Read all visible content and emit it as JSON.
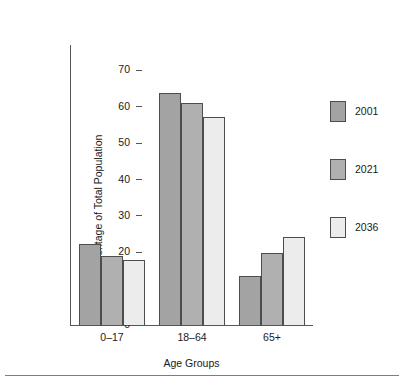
{
  "chart_data": {
    "type": "bar",
    "title": "",
    "subtitle": "",
    "xlabel": "Age Groups",
    "ylabel": "Percentage of Total Population",
    "categories": [
      "0–17",
      "18–64",
      "65+"
    ],
    "series": [
      {
        "name": "2001",
        "color": "#a3a3a3",
        "values": [
          22.4,
          63.7,
          13.5
        ]
      },
      {
        "name": "2021",
        "color": "#b0b0b0",
        "values": [
          19.0,
          61.0,
          19.8
        ]
      },
      {
        "name": "2036",
        "color": "#ececec",
        "values": [
          18.0,
          57.3,
          24.3
        ]
      }
    ],
    "ylim": [
      0,
      77
    ],
    "yticks": [
      0,
      10,
      20,
      30,
      40,
      50,
      60,
      70
    ],
    "ytick_labels": [
      "0",
      "10",
      "20",
      "30",
      "40",
      "50",
      "60",
      "70"
    ],
    "grid": false,
    "legend_position": "right",
    "annotations": []
  },
  "axes": {
    "y_title": "Percentage of Total Population",
    "x_title": "Age Groups",
    "tick_0": "0",
    "tick_10": "10",
    "tick_20": "20",
    "tick_30": "30",
    "tick_40": "40",
    "tick_50": "50",
    "tick_60": "60",
    "tick_70": "70"
  },
  "groups": {
    "g0": "0–17",
    "g1": "18–64",
    "g2": "65+"
  },
  "legend": {
    "items": [
      {
        "label": "2001"
      },
      {
        "label": "2021"
      },
      {
        "label": "2036"
      }
    ]
  },
  "top_remnant": ""
}
